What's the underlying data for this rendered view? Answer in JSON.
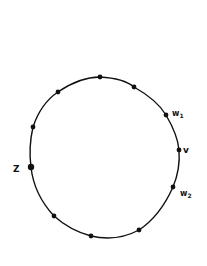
{
  "diagram": {
    "type": "cycle-graph",
    "stroke_color": "#111111",
    "background": "#ffffff",
    "cycle_path": "M100,77 C118,78 128,82 134,87 C150,96 160,105 166,115 C173,127 178,138 179,150 C180,163 178,175 173,187 C165,205 154,220 139,230 C124,238 108,240 91,236 C76,232 64,225 54,216 C41,202 33,186 31,167 C29,152 30,140 33,127 C38,112 46,100 58,92 C71,83 85,77 100,77 Z",
    "vertices": [
      {
        "id": "top",
        "label": "",
        "x": 100,
        "y": 77,
        "r": 2.4
      },
      {
        "id": "upper-right",
        "label": "",
        "x": 134,
        "y": 87,
        "r": 2.4
      },
      {
        "id": "w1",
        "label": "w1",
        "x": 166,
        "y": 115,
        "r": 2.4
      },
      {
        "id": "v",
        "label": "v",
        "x": 179,
        "y": 150,
        "r": 2.4
      },
      {
        "id": "w2",
        "label": "w2",
        "x": 173,
        "y": 187,
        "r": 2.4
      },
      {
        "id": "lower-right",
        "label": "",
        "x": 139,
        "y": 230,
        "r": 2.4
      },
      {
        "id": "bottom",
        "label": "",
        "x": 91,
        "y": 236,
        "r": 2.4
      },
      {
        "id": "lower-left",
        "label": "",
        "x": 54,
        "y": 216,
        "r": 2.4
      },
      {
        "id": "z",
        "label": "Z",
        "x": 31,
        "y": 167,
        "r": 3.2
      },
      {
        "id": "left",
        "label": "",
        "x": 33,
        "y": 127,
        "r": 2.4
      },
      {
        "id": "upper-left",
        "label": "",
        "x": 58,
        "y": 92,
        "r": 2.4
      }
    ],
    "labels": {
      "w1": {
        "base": "w",
        "sub": "1",
        "x": 172,
        "y": 116
      },
      "v": {
        "text": "v",
        "x": 183,
        "y": 153
      },
      "w2": {
        "base": "w",
        "sub": "2",
        "x": 180,
        "y": 196
      },
      "z": {
        "text": "Z",
        "x": 13,
        "y": 172
      }
    }
  }
}
